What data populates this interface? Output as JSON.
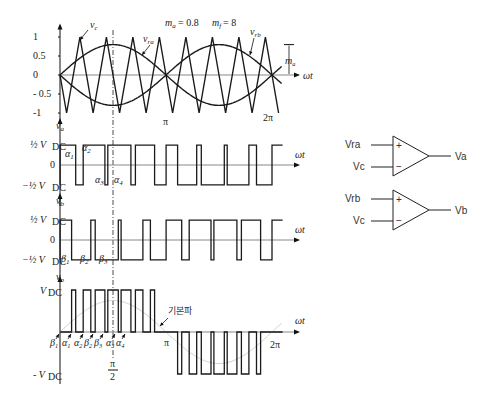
{
  "params": {
    "ma": 0.8,
    "mf": 8
  },
  "colors": {
    "line": "#1a1a1a",
    "axis": "#888888",
    "faint": "#cfcfcf"
  },
  "labels": {
    "ma_text": "m_a = 0.8",
    "mf_text": "m_f = 8",
    "vc": "v_c",
    "vra": "v_ra",
    "vrb": "v_rb",
    "ma_arrow": "m_a",
    "omega_t": "ωt",
    "pi": "π",
    "two_pi": "2π",
    "pi_over_2_num": "π",
    "pi_over_2_den": "2",
    "fundamental": "기본파",
    "va": "v_a",
    "vb": "v_b",
    "vo": "v_o",
    "half_vdc_pos": "1/2 V_DC",
    "half_vdc_neg": "-1/2 V_DC",
    "vdc_pos": "V_DC",
    "vdc_neg": "- V_DC",
    "zero": "0"
  },
  "top_yticks": [
    "1",
    "0.5",
    "0",
    "- 0.5",
    "-1"
  ],
  "alpha_labels": [
    "α1",
    "α2",
    "α3",
    "α4"
  ],
  "beta_labels": [
    "β1",
    "β2",
    "β3"
  ],
  "bottom_angle_labels": [
    "β1",
    "α1",
    "α2",
    "β2",
    "β3",
    "α3",
    "α4"
  ],
  "comparators": [
    {
      "plus": "Vra",
      "minus": "Vc",
      "out": "Va"
    },
    {
      "plus": "Vrb",
      "minus": "Vc",
      "out": "Vb"
    }
  ]
}
